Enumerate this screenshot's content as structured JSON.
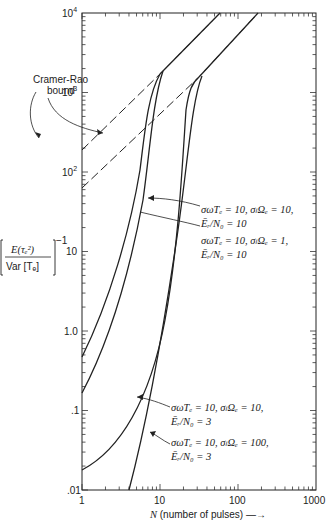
{
  "chart_data": {
    "type": "line",
    "title": "",
    "xlabel": "N (number of pulses) →",
    "ylabel": "[E(τₑ²) / Var[Tₑ]]⁻¹",
    "xscale": "log",
    "yscale": "log",
    "xlim": [
      1,
      1000
    ],
    "ylim": [
      0.01,
      10000
    ],
    "x_ticks": [
      "1",
      "10",
      "100",
      "1000"
    ],
    "y_ticks": [
      ".01",
      ".1",
      "1.0",
      "10",
      "10²",
      "10³",
      "10⁴"
    ],
    "series": [
      {
        "name": "σωTₑ = 10, σₗΩₑ = 10, Ēᵣ/N₀ = 10",
        "style": "solid",
        "x": [
          1,
          2,
          3,
          4,
          5,
          6,
          7,
          8,
          9
        ],
        "y": [
          0.45,
          2.0,
          8,
          30,
          110,
          350,
          900,
          1500,
          1800
        ]
      },
      {
        "name": "σωTₑ = 10, σₗΩₑ = 1, Ēᵣ/N₀ = 10",
        "style": "solid",
        "x": [
          1,
          2,
          3,
          4,
          5,
          6,
          7,
          8,
          9,
          10
        ],
        "y": [
          0.045,
          0.2,
          0.8,
          3,
          12,
          50,
          200,
          600,
          1300,
          2000
        ]
      },
      {
        "name": "σωTₑ = 10, σₗΩₑ = 10, Ēᵣ/N₀ = 3",
        "style": "solid",
        "x": [
          1,
          2,
          4,
          6,
          10,
          15,
          20,
          25,
          30
        ],
        "y": [
          0.017,
          0.04,
          0.15,
          0.6,
          5,
          50,
          300,
          900,
          1500
        ]
      },
      {
        "name": "σωTₑ = 10, σₗΩₑ = 100, Ēᵣ/N₀ = 3",
        "style": "solid",
        "x": [
          4,
          6,
          10,
          15,
          20,
          25,
          30,
          35
        ],
        "y": [
          0.01,
          0.05,
          0.5,
          5,
          50,
          300,
          1000,
          1600
        ]
      },
      {
        "name": "Cramer-Rao bound (Ēᵣ/N₀ = 10)",
        "style": "dashed",
        "x": [
          1,
          10,
          80
        ],
        "y": [
          180,
          1800,
          10000
        ]
      },
      {
        "name": "Cramer-Rao bound (Ēᵣ/N₀ = 3)",
        "style": "dashed",
        "x": [
          1,
          30,
          200
        ],
        "y": [
          60,
          1600,
          10000
        ]
      }
    ],
    "annotations": [
      "Cramer-Rao bound",
      "σωTₑ = 10, σₗΩₑ = 10, Ēᵣ/N₀ = 10",
      "σωTₑ = 10, σₗΩₑ = 1, Ēᵣ/N₀ = 10",
      "σωTₑ = 10, σₗΩₑ = 10, Ēᵣ/N₀ = 3",
      "σωTₑ = 10, σₗΩₑ = 100, Ēᵣ/N₀ = 3"
    ],
    "grid": false,
    "legend": "none (inline annotations)"
  },
  "labels": {
    "y_ticks": {
      "t10000": "10",
      "t10000_exp": "4",
      "t1000": "10",
      "t1000_exp": "3",
      "t100": "10",
      "t100_exp": "2",
      "t10": "10",
      "t1": "1.0",
      "t01": ".1",
      "t001": ".01"
    },
    "x_ticks": {
      "t1": "1",
      "t10": "10",
      "t100": "100",
      "t1000": "1000"
    },
    "xlabel_var": "N",
    "xlabel_text": " (number of pulses) —→",
    "ylabel_num": "E(τₑ²)",
    "ylabel_den": "Var [Tₑ]",
    "ylabel_exp": "−1",
    "cr_line1": "Cramer-Rao",
    "cr_line2": "bound",
    "ann_a1": "σωTₑ = 10, σₗΩₑ = 10,",
    "ann_a2": "Ēᵣ/N₀ = 10",
    "ann_b1": "σωTₑ = 10, σₗΩₑ = 1,",
    "ann_b2": "Ēᵣ/N₀ = 10",
    "ann_c1": "σωTₑ = 10, σₗΩₑ = 10,",
    "ann_c2": "Ēᵣ/N₀ = 3",
    "ann_d1": "σωTₑ = 10, σₗΩₑ = 100,",
    "ann_d2": "Ēᵣ/N₀ = 3"
  }
}
